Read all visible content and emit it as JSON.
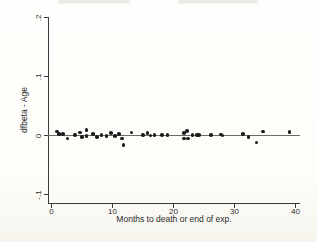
{
  "figure": {
    "background_outer": "#fdfcf6",
    "background_plot": "#ffffff"
  },
  "chart_data": {
    "type": "scatter",
    "title": "",
    "xlabel": "Months to death or end of exp.",
    "ylabel": "dfbeta - Age",
    "xlim": [
      0,
      41
    ],
    "ylim": [
      -0.1,
      0.2
    ],
    "x_ticks": [
      0,
      10,
      20,
      30,
      40
    ],
    "x_tick_labels": [
      "0",
      "10",
      "20",
      "30",
      "40"
    ],
    "y_ticks": [
      0.2,
      0.1,
      0,
      -0.1
    ],
    "y_tick_labels": [
      ".2",
      ".1",
      "0",
      "-.1"
    ],
    "y_tick_label_rotation": -90,
    "reference_line_y": 0,
    "grid": false,
    "legend": false,
    "marker_color": "#1c1c1c",
    "axis_color": "#3a3a3a",
    "reference_line_color": "#6a6a6a",
    "points": [
      [
        1.0,
        0.006
      ],
      [
        1.3,
        0.002
      ],
      [
        2.0,
        0.002
      ],
      [
        2.7,
        -0.006
      ],
      [
        3.9,
        0.0
      ],
      [
        4.8,
        0.004
      ],
      [
        5.1,
        -0.003
      ],
      [
        5.8,
        0.008
      ],
      [
        5.8,
        -0.002
      ],
      [
        6.9,
        0.002
      ],
      [
        7.5,
        -0.003
      ],
      [
        8.3,
        0.0
      ],
      [
        9.1,
        -0.002
      ],
      [
        9.8,
        0.003
      ],
      [
        10.5,
        -0.002
      ],
      [
        11.1,
        0.002
      ],
      [
        11.6,
        -0.006
      ],
      [
        11.9,
        -0.017
      ],
      [
        13.2,
        0.004
      ],
      [
        15.1,
        0.0
      ],
      [
        15.8,
        0.003
      ],
      [
        16.3,
        -0.001
      ],
      [
        17.0,
        0.0
      ],
      [
        18.2,
        0.0
      ],
      [
        19.1,
        0.0
      ],
      [
        21.8,
        0.003
      ],
      [
        21.8,
        -0.006
      ],
      [
        22.3,
        0.007
      ],
      [
        22.5,
        -0.006
      ],
      [
        23.2,
        0.0
      ],
      [
        23.9,
        0.0
      ],
      [
        24.3,
        0.0
      ],
      [
        26.2,
        0.0
      ],
      [
        27.9,
        0.001
      ],
      [
        28.1,
        -0.001
      ],
      [
        31.5,
        0.002
      ],
      [
        32.4,
        -0.003
      ],
      [
        33.7,
        -0.013
      ],
      [
        34.8,
        0.006
      ],
      [
        39.1,
        0.005
      ]
    ]
  }
}
